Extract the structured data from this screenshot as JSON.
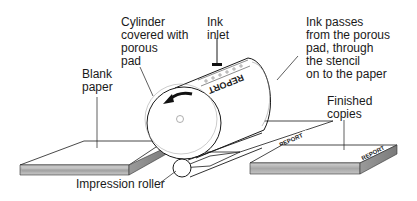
{
  "diagram": {
    "labels": {
      "cylinder": "Cylinder\ncovered with\nporous\npad",
      "ink_inlet": "Ink\ninlet",
      "ink_passes": "Ink passes\nfrom the porous\npad, through\nthe stencil\non to the paper",
      "blank_paper": "Blank\npaper",
      "finished_copies": "Finished\ncopies",
      "impression_roller": "Impression roller"
    },
    "stencil_text": "REPORT",
    "components": [
      "blank-paper-stack",
      "cylinder",
      "ink-inlet",
      "rotation-arrow",
      "impression-roller",
      "paper-sheet",
      "finished-copies-stack"
    ],
    "colors": {
      "line": "#1a1a1a",
      "stack_edge": "#b8b8b8",
      "stack_edge_dark": "#8a8a8a",
      "background": "#ffffff"
    }
  }
}
